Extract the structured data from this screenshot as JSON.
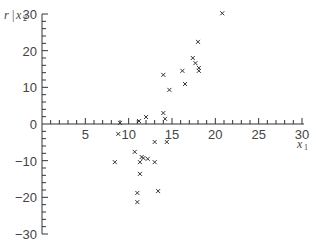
{
  "chart_data": {
    "type": "scatter",
    "title": "",
    "xlabel": "x1",
    "ylabel": "r | x2",
    "xlim": [
      0,
      30
    ],
    "ylim": [
      -30,
      30
    ],
    "x_ticks": [
      5,
      10,
      15,
      20,
      25,
      30
    ],
    "y_ticks": [
      30,
      20,
      10,
      0,
      -10,
      -20,
      -30
    ],
    "grid": false,
    "legend": null,
    "marker": "x",
    "series": [
      {
        "name": "points",
        "x": [
          20.8,
          18.0,
          17.4,
          17.7,
          18.1,
          18.1,
          16.2,
          14.0,
          16.5,
          14.7,
          14.0,
          14.2,
          12.0,
          11.2,
          9.0,
          8.8,
          13.0,
          14.4,
          10.7,
          11.5,
          11.7,
          12.2,
          13.0,
          11.3,
          8.4,
          11.3,
          13.4,
          11.0,
          11.0
        ],
        "y": [
          30.2,
          22.4,
          18.0,
          16.6,
          15.3,
          14.5,
          14.5,
          13.4,
          10.9,
          9.3,
          3.0,
          1.4,
          1.9,
          0.8,
          0.3,
          -2.7,
          -4.9,
          -4.9,
          -7.6,
          -9.0,
          -9.3,
          -9.5,
          -10.4,
          -10.4,
          -10.4,
          -13.6,
          -18.3,
          -18.8,
          -21.3
        ]
      }
    ]
  },
  "labels": {
    "y_axis_r": "r",
    "y_axis_bar": "|",
    "y_axis_x": "x",
    "y_axis_sub": "2",
    "x_axis_x": "x",
    "x_axis_sub": "1"
  }
}
